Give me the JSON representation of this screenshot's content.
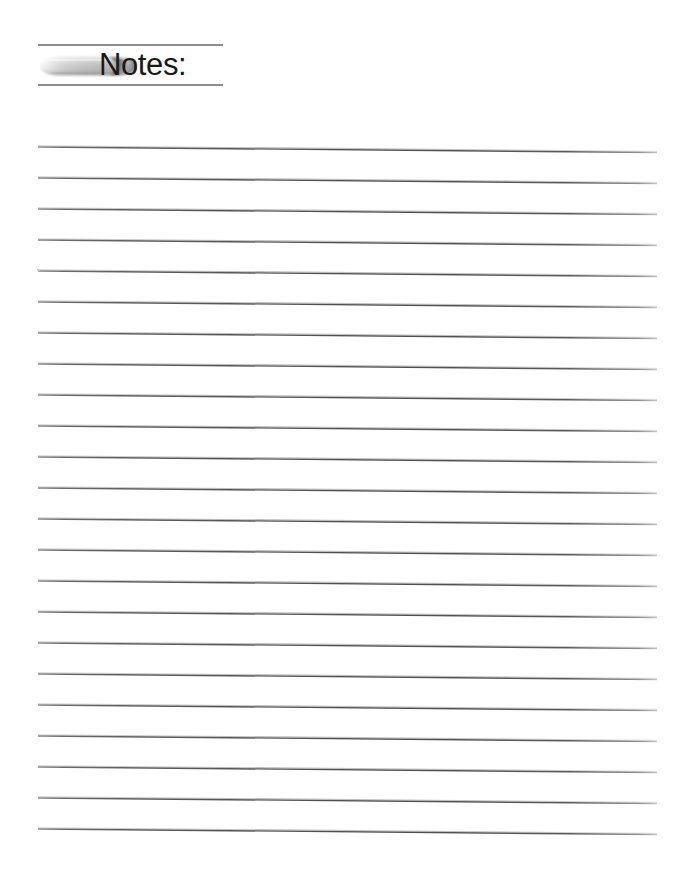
{
  "page": {
    "width": 677,
    "height": 892,
    "background_color": "#ffffff",
    "type": "lined-note-page"
  },
  "header": {
    "title": "Notes:",
    "title_color": "#1a1a1a",
    "icon_name": "eraser-icon",
    "icon_description": "grayscale pencil eraser, rounded worn tip pointing right",
    "rule_color": "#6e6e6e",
    "rule_left_x": 38,
    "rule_right_x": 223,
    "rule_top_y": 46,
    "rule_bottom_y": 84
  },
  "body": {
    "line_count": 23,
    "line_color": "#5a5a5a",
    "line_highlight_color": "#b5b5b5",
    "line_left_x": 38,
    "line_right_x": 657,
    "first_line_y": 147,
    "line_spacing": 31,
    "line_tilt_px": 5.5,
    "line_thickness": 1.4
  },
  "artifacts": {
    "scan_speck_present": true,
    "scan_speck_x": 37,
    "scan_speck_y": 269
  }
}
